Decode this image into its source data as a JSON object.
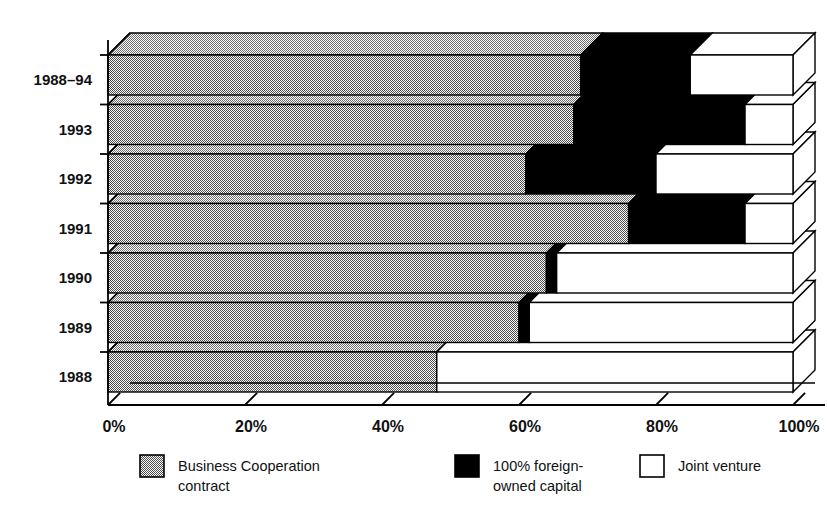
{
  "chart_data": {
    "type": "bar",
    "orientation": "horizontal",
    "stacked": true,
    "percent_stacked": true,
    "three_d": true,
    "title": "",
    "subtitle": "",
    "xlabel": "",
    "ylabel": "",
    "xlim": [
      0,
      100
    ],
    "ylim": null,
    "grid": false,
    "legend_position": "bottom",
    "categories": [
      "1988–94",
      "1993",
      "1992",
      "1991",
      "1990",
      "1989",
      "1988"
    ],
    "x_tick_labels": [
      "0%",
      "20%",
      "40%",
      "60%",
      "80%",
      "100%"
    ],
    "x_tick_values": [
      0,
      20,
      40,
      60,
      80,
      100
    ],
    "series": [
      {
        "name": "Business Cooperation contract",
        "fill": "gray-dotted",
        "color": "#8a8a8a",
        "values": [
          69,
          68,
          61,
          76,
          64,
          60,
          48
        ]
      },
      {
        "name": "100% foreign-owned capital",
        "fill": "solid-black",
        "color": "#000000",
        "values": [
          16,
          25,
          19,
          17,
          1.5,
          1.5,
          0
        ]
      },
      {
        "name": "Joint venture",
        "fill": "white",
        "color": "#ffffff",
        "values": [
          15,
          7,
          20,
          7,
          34.5,
          38.5,
          52
        ]
      }
    ]
  },
  "axis": {
    "y_labels": [
      "1988–94",
      "1993",
      "1992",
      "1991",
      "1990",
      "1989",
      "1988"
    ],
    "x_labels": [
      "0%",
      "20%",
      "40%",
      "60%",
      "80%",
      "100%"
    ],
    "x_last_label_clipped": "100%"
  },
  "legend": {
    "items": [
      {
        "label_line1": "Business Cooperation",
        "label_line2": "contract",
        "swatch": "gray-dotted-swatch"
      },
      {
        "label_line1": "100% foreign-",
        "label_line2": "owned capital",
        "swatch": "black-swatch"
      },
      {
        "label_line1": "Joint venture",
        "label_line2": "",
        "swatch": "white-swatch"
      }
    ]
  },
  "colors": {
    "series_business_cooperation": "#8a8a8a",
    "series_foreign_owned": "#000000",
    "series_joint_venture": "#ffffff",
    "axis_line": "#000000",
    "background": "#ffffff"
  }
}
